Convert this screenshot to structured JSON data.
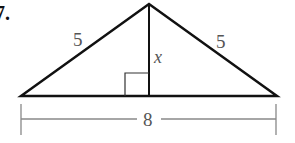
{
  "problem": {
    "number": "7."
  },
  "diagram": {
    "type": "isosceles-triangle-with-altitude",
    "labels": {
      "left_side": "5",
      "right_side": "5",
      "altitude": "x",
      "base": "8"
    },
    "colors": {
      "stroke": "#111111",
      "label": "#555555",
      "dimension_line": "#888888"
    }
  }
}
